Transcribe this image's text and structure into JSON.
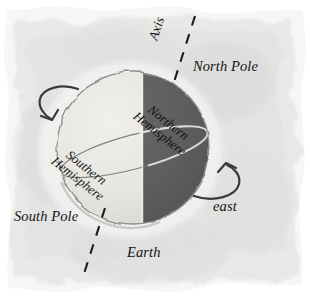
{
  "figure": {
    "title": "Earth",
    "medium": "watercolor-wash-diagram",
    "background_color": "#efeeec",
    "globe": {
      "center_x": 133,
      "center_y": 148,
      "radius": 76,
      "lit_half_color": "#ecebe6",
      "dark_half_color": "#5a5a5a",
      "outline_color": "#8d8d8d",
      "equator_color": "#7a7a7a",
      "terminator_x": 143
    },
    "axis": {
      "dash_color": "#1b1b1b",
      "top_point": [
        194,
        17
      ],
      "bottom_point": [
        81,
        283
      ]
    }
  },
  "labels": {
    "axis": "Axis",
    "north_pole": "North Pole",
    "south_pole": "South Pole",
    "earth": "Earth",
    "east": "east",
    "northern_hemisphere_line1": "Northern",
    "northern_hemisphere_line2": "Hemisphere",
    "southern_hemisphere_line1": "Southern",
    "southern_hemisphere_line2": "Hemisphere"
  },
  "arrows": {
    "left_rotation_arrow": "rotation-arrow-left",
    "right_rotation_arrow": "rotation-arrow-right",
    "color": "#3c3c3c"
  }
}
